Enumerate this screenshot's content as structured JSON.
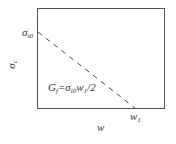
{
  "diagram": {
    "type": "linear softening curve",
    "box": {
      "x": 37,
      "y": 8,
      "width": 127,
      "height": 100,
      "stroke": "#555555"
    },
    "dashed_line": {
      "from": [
        37,
        32
      ],
      "to": [
        135,
        108
      ],
      "stroke": "#444444"
    },
    "labels": {
      "y_axis": {
        "symbol": "σ",
        "sub": "c"
      },
      "y_peak": {
        "symbol": "σ",
        "sub": "t0"
      },
      "x_axis": {
        "symbol": "w"
      },
      "x_end": {
        "symbol": "w",
        "sub": "1"
      },
      "equation": {
        "lhs": "G",
        "lhs_sub": "f",
        "eq": "=",
        "sig": "σ",
        "sig_sub": "t0",
        "w": "w",
        "w_sub": "1",
        "tail": "/2"
      }
    }
  }
}
